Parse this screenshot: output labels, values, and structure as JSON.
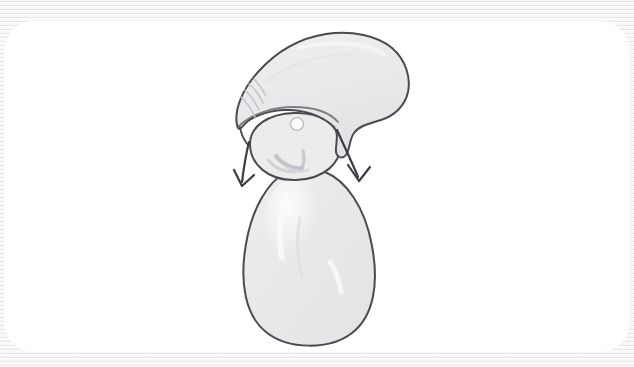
{
  "canvas": {
    "width": 634,
    "height": 367,
    "background_color": "#f1f1f2",
    "card_color": "#ffffff",
    "card_radius_px": 30,
    "title": "Pencil sketch"
  },
  "drawing": {
    "medium": "pencil sketch",
    "subject": "gnome figure with floppy pointed hat",
    "description": "Hand-drawn light pencil sketch of a gnome: a large droopy cap sweeping up to the right, a round head below it with a small round nose and a beard, an egg-shaped body, and two curved arrows pointing down and outward from the sides of the head.",
    "line_color": "#4a4a50",
    "fill_color": "#ededee",
    "shade_color": "#e2e2e4",
    "highlight_color": "#fbfbfc",
    "line_width_px": 2,
    "parts": [
      {
        "name": "hat",
        "label": "floppy pointed cap"
      },
      {
        "name": "hat-fold-hatching",
        "label": "fold hatching on left of cap"
      },
      {
        "name": "head",
        "label": "round head"
      },
      {
        "name": "nose",
        "label": "small round nose"
      },
      {
        "name": "beard",
        "label": "beard strokes"
      },
      {
        "name": "body",
        "label": "egg shaped body"
      },
      {
        "name": "arrow-left",
        "label": "left arrow pointing down-left"
      },
      {
        "name": "arrow-right",
        "label": "right arrow pointing down-right"
      }
    ]
  },
  "annotations": {
    "arrow_count": 2,
    "arrow_left_direction": "down-left",
    "arrow_right_direction": "down-right"
  }
}
